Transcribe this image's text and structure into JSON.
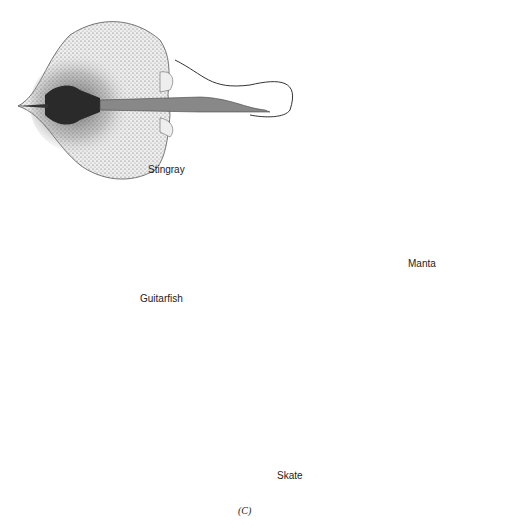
{
  "figure": {
    "panel_caption": "(C)",
    "specimens": [
      {
        "id": "stingray",
        "label": "Stingray"
      },
      {
        "id": "guitarfish",
        "label": "Guitarfish"
      },
      {
        "id": "manta",
        "label": "Manta"
      },
      {
        "id": "skate",
        "label": "Skate"
      }
    ]
  }
}
